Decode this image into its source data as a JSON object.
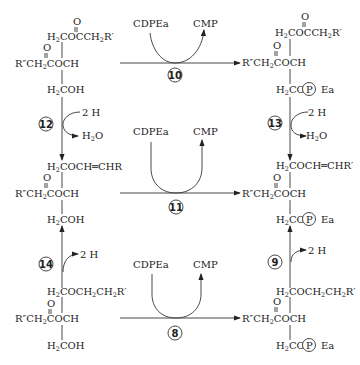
{
  "diagram": {
    "reagents": {
      "donor": "CDPEa",
      "product": "CMP",
      "two_h": "2 H",
      "water_h": "H",
      "water_sub": "2",
      "water_o": "O"
    },
    "steps": {
      "s10": "10",
      "s11": "11",
      "s8": "8",
      "s12": "12",
      "s13": "13",
      "s14": "14",
      "s9": "9"
    },
    "phospho": {
      "p": "P",
      "ea": "Ea"
    },
    "labels": {
      "carbonyl_o": "O",
      "r_dprime": "R″CH",
      "ch2coch": "COCH",
      "h_prefix": "H",
      "sub2": "2",
      "coh": "COH",
      "co": "CO",
      "cocch2r": "COCCH",
      "r_prime": "R′",
      "coch_chr": "COCH═CHR",
      "coch_chr_prime": "COCH═CHR′",
      "coch2": "COCH",
      "ch2": "CH"
    }
  }
}
